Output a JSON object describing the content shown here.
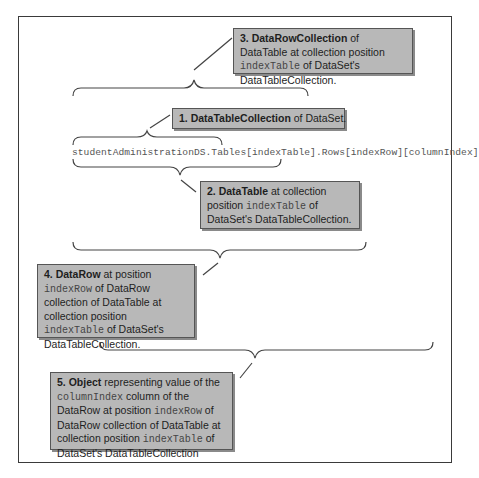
{
  "diagram": {
    "code_expression": "studentAdministrationDS.Tables[indexTable].Rows[indexRow][columnIndex]",
    "callouts": [
      {
        "id": 1,
        "number": "1.",
        "term": "DataTableCollection",
        "parts": [
          {
            "type": "text",
            "value": " of DataSet."
          }
        ]
      },
      {
        "id": 2,
        "number": "2.",
        "term": "DataTable",
        "parts": [
          {
            "type": "text",
            "value": " at collection position "
          },
          {
            "type": "code",
            "value": "indexTable"
          },
          {
            "type": "text",
            "value": " of DataSet's DataTableCollection."
          }
        ]
      },
      {
        "id": 3,
        "number": "3.",
        "term": "DataRowCollection",
        "parts": [
          {
            "type": "text",
            "value": " of DataTable at collection position "
          },
          {
            "type": "code",
            "value": "indexTable"
          },
          {
            "type": "text",
            "value": " of DataSet's DataTableCollection."
          }
        ]
      },
      {
        "id": 4,
        "number": "4.",
        "term": "DataRow",
        "parts": [
          {
            "type": "text",
            "value": " at position "
          },
          {
            "type": "code",
            "value": "indexRow"
          },
          {
            "type": "text",
            "value": " of DataRow collection of DataTable at collection position "
          },
          {
            "type": "code",
            "value": "indexTable"
          },
          {
            "type": "text",
            "value": " of DataSet's DataTableCollection."
          }
        ]
      },
      {
        "id": 5,
        "number": "5.",
        "term": "Object",
        "parts": [
          {
            "type": "text",
            "value": " representing value of the "
          },
          {
            "type": "code",
            "value": "columnIndex"
          },
          {
            "type": "text",
            "value": " column of the DataRow at position "
          },
          {
            "type": "code",
            "value": "indexRow"
          },
          {
            "type": "text",
            "value": " of DataRow collection of DataTable at collection position "
          },
          {
            "type": "code",
            "value": "indexTable"
          },
          {
            "type": "text",
            "value": " of DataSet's DataTableCollection"
          }
        ]
      }
    ],
    "colors": {
      "callout_fill": "#b8b8b8",
      "callout_border": "#555555",
      "line": "#444444",
      "frame": "#3a3a3a"
    }
  }
}
